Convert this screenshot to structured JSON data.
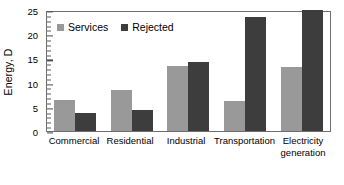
{
  "chart_data": {
    "type": "bar",
    "title": "",
    "xlabel": "",
    "ylabel": "Energy, D",
    "ylim": [
      0,
      25
    ],
    "ytick_values": [
      0,
      5,
      10,
      15,
      20,
      25
    ],
    "ytick_labels": [
      "0",
      "5",
      "10",
      "15",
      "20",
      "25"
    ],
    "minor_tick_interval": 1,
    "grid": false,
    "legend_position": "top-left-inside",
    "categories": [
      "Commercial",
      "Residential",
      "Industrial",
      "Transportation",
      "Electricity generation"
    ],
    "category_lines": [
      [
        "Commercial"
      ],
      [
        "Residential"
      ],
      [
        "Industrial"
      ],
      [
        "Transportation"
      ],
      [
        "Electricity",
        "generation"
      ]
    ],
    "series": [
      {
        "name": "Services",
        "color": "#999999",
        "values": [
          6.5,
          8.4,
          13.5,
          6.3,
          13.3
        ]
      },
      {
        "name": "Rejected",
        "color": "#3d3d3d",
        "values": [
          3.7,
          4.4,
          14.2,
          23.5,
          25.0
        ]
      }
    ]
  },
  "colors": {
    "services": "#999999",
    "rejected": "#3d3d3d",
    "axis": "#6f6f6f",
    "text": "#000000",
    "background": "#ffffff"
  }
}
